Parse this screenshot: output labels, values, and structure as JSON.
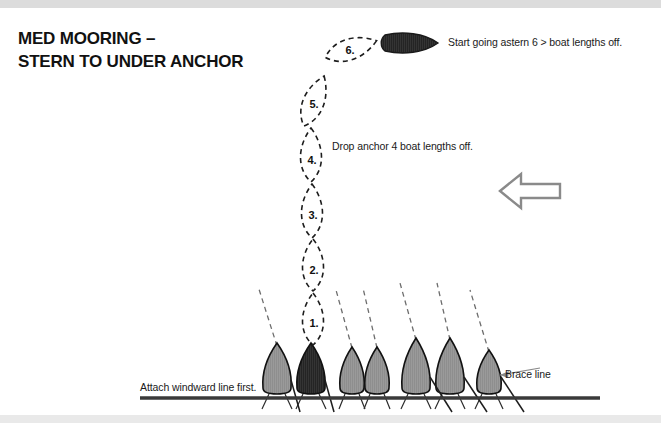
{
  "page": {
    "background": "#ffffff",
    "band_color": "#dcdcdc",
    "width": 661,
    "height": 423
  },
  "title": {
    "line1": "MED MOORING –",
    "line2": "STERN TO UNDER ANCHOR"
  },
  "annotations": {
    "astern": "Start going astern 6 > boat lengths off.",
    "anchor": "Drop anchor 4 boat lengths off.",
    "windward": "Attach windward line first.",
    "brace": "Brace line"
  },
  "track": {
    "description": "Dashed boat positions along approach track",
    "positions": [
      {
        "label": "1.",
        "cx": 313,
        "cy": 319,
        "rx": 14,
        "ry": 26,
        "rotate": 0
      },
      {
        "label": "2.",
        "cx": 313,
        "cy": 265,
        "rx": 14,
        "ry": 26,
        "rotate": 0
      },
      {
        "label": "3.",
        "cx": 312,
        "cy": 211,
        "rx": 14,
        "ry": 27,
        "rotate": 0
      },
      {
        "label": "4.",
        "cx": 311,
        "cy": 155,
        "rx": 14,
        "ry": 27,
        "rotate": 0
      },
      {
        "label": "5.",
        "cx": 314,
        "cy": 101,
        "rx": 14,
        "ry": 27,
        "rotate": 22
      },
      {
        "label": "6.",
        "cx": 351,
        "cy": 49,
        "rx": 27,
        "ry": 13,
        "rotate": -18
      }
    ]
  },
  "moving_boat": {
    "name": "boat-under-way",
    "cx": 409,
    "cy": 43,
    "rx": 28,
    "ry": 10,
    "fill": "#2b2b2b",
    "heading": "right"
  },
  "wind_arrow": {
    "name": "wind-direction-arrow",
    "direction": "left",
    "color": "#8a8a8a",
    "x": 498,
    "y": 176,
    "width": 62,
    "height": 30
  },
  "dock": {
    "y": 398,
    "x_start": 140,
    "x_end": 600,
    "color": "#3a3a3a",
    "thickness": 3.5
  },
  "moored_boats": [
    {
      "cx": 277,
      "fill": "#9a9a9a",
      "rode": true
    },
    {
      "cx": 311,
      "fill": "#242424",
      "rode": false
    },
    {
      "cx": 352,
      "fill": "#9a9a9a",
      "rode": true
    },
    {
      "cx": 377,
      "fill": "#9a9a9a",
      "rode": true
    },
    {
      "cx": 416,
      "fill": "#9a9a9a",
      "rode": true
    },
    {
      "cx": 450,
      "fill": "#9a9a9a",
      "rode": true
    },
    {
      "cx": 489,
      "fill": "#9a9a9a",
      "rode": true
    }
  ],
  "colors": {
    "hull_gray": "#9a9a9a",
    "hull_dark": "#242424",
    "outline": "#111111",
    "dash": "#555555",
    "text": "#1a1a1a"
  }
}
